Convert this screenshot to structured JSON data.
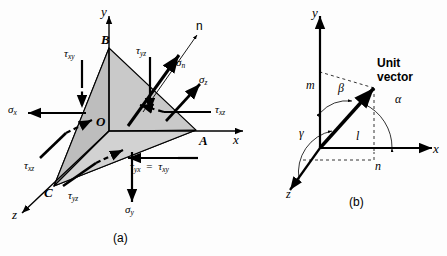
{
  "figure": {
    "panels": [
      {
        "id": "a",
        "caption": "(a)",
        "axes": [
          {
            "name": "y-axis",
            "label": "y"
          },
          {
            "name": "x-axis",
            "label": "x"
          },
          {
            "name": "z-axis",
            "label": "z"
          }
        ],
        "vertices": [
          {
            "name": "vertex-B",
            "label": "B"
          },
          {
            "name": "origin-O",
            "label": "O"
          },
          {
            "name": "vertex-A",
            "label": "A"
          },
          {
            "name": "vertex-C",
            "label": "C"
          }
        ],
        "normal_label": "n",
        "stresses": [
          {
            "name": "tau-xy",
            "sym": "τ",
            "sub": "xy"
          },
          {
            "name": "tau-yz-upper",
            "sym": "τ",
            "sub": "yz"
          },
          {
            "name": "sigma-n",
            "sym": "σ",
            "sub": "n"
          },
          {
            "name": "sigma-z",
            "sym": "σ",
            "sub": "z"
          },
          {
            "name": "tau-xz-right",
            "sym": "τ",
            "sub": "xz"
          },
          {
            "name": "sigma-x",
            "sym": "σ",
            "sub": "x"
          },
          {
            "name": "tau-xz-left",
            "sym": "τ",
            "sub": "xz"
          },
          {
            "name": "tau-yz-lower",
            "sym": "τ",
            "sub": "yz"
          },
          {
            "name": "sigma-y",
            "sym": "σ",
            "sub": "y"
          }
        ],
        "equality": {
          "name": "tau-yx-equals-tau-xy",
          "left_sym": "τ",
          "left_sub": "yx",
          "eq": "=",
          "right_sym": "τ",
          "right_sub": "xy"
        }
      },
      {
        "id": "b",
        "caption": "(b)",
        "axes": [
          {
            "name": "y-axis",
            "label": "y"
          },
          {
            "name": "x-axis",
            "label": "x"
          },
          {
            "name": "z-axis",
            "label": "z"
          }
        ],
        "unit_vector_label_line1": "Unit",
        "unit_vector_label_line2": "vector",
        "angles": [
          {
            "name": "angle-alpha",
            "label": "α"
          },
          {
            "name": "angle-beta",
            "label": "β"
          },
          {
            "name": "angle-gamma",
            "label": "γ"
          }
        ],
        "direction_cosines": [
          {
            "name": "cosine-m",
            "label": "m"
          },
          {
            "name": "cosine-l",
            "label": "l"
          },
          {
            "name": "cosine-n",
            "label": "n"
          }
        ]
      }
    ],
    "colors": {
      "face_fill": "#c9c9c9",
      "face_fill_light": "#d6d6d6",
      "stroke": "#000000",
      "background": "#fdfdfd"
    }
  }
}
